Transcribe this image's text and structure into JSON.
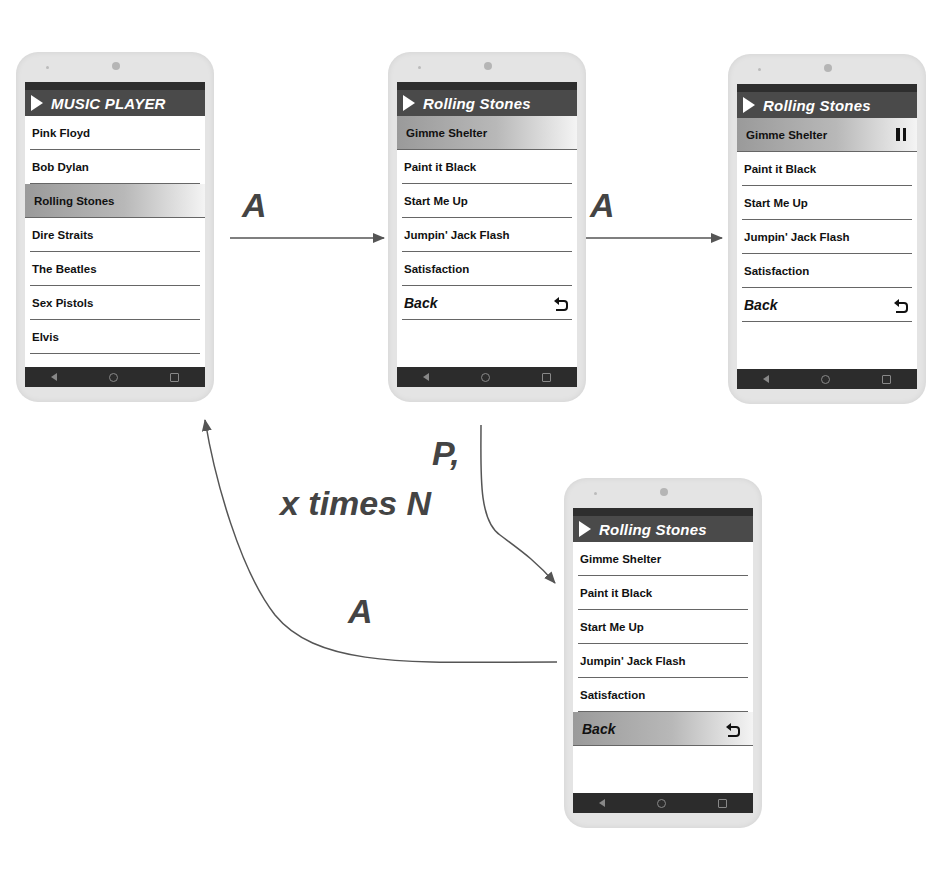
{
  "diagram": {
    "type": "state-transition"
  },
  "phones": [
    {
      "id": "artist-list",
      "title": "MUSIC PLAYER",
      "items": [
        {
          "label": "Pink Floyd",
          "highlighted": false
        },
        {
          "label": "Bob Dylan",
          "highlighted": false
        },
        {
          "label": "Rolling Stones",
          "highlighted": true
        },
        {
          "label": "Dire Straits",
          "highlighted": false
        },
        {
          "label": "The Beatles",
          "highlighted": false
        },
        {
          "label": "Sex Pistols",
          "highlighted": false
        },
        {
          "label": "Elvis",
          "highlighted": false
        }
      ]
    },
    {
      "id": "song-list",
      "title": "Rolling Stones",
      "items": [
        {
          "label": "Gimme Shelter",
          "highlighted": true
        },
        {
          "label": "Paint it Black",
          "highlighted": false
        },
        {
          "label": "Start Me Up",
          "highlighted": false
        },
        {
          "label": "Jumpin' Jack Flash",
          "highlighted": false
        },
        {
          "label": "Satisfaction",
          "highlighted": false
        },
        {
          "label": "Back",
          "highlighted": false,
          "icon": "back-icon"
        }
      ]
    },
    {
      "id": "song-playing",
      "title": "Rolling Stones",
      "items": [
        {
          "label": "Gimme Shelter",
          "highlighted": true,
          "icon": "pause-icon"
        },
        {
          "label": "Paint it Black",
          "highlighted": false
        },
        {
          "label": "Start Me Up",
          "highlighted": false
        },
        {
          "label": "Jumpin' Jack Flash",
          "highlighted": false
        },
        {
          "label": "Satisfaction",
          "highlighted": false
        },
        {
          "label": "Back",
          "highlighted": false,
          "icon": "back-icon"
        }
      ]
    },
    {
      "id": "back-selected",
      "title": "Rolling Stones",
      "items": [
        {
          "label": "Gimme Shelter",
          "highlighted": false
        },
        {
          "label": "Paint it Black",
          "highlighted": false
        },
        {
          "label": "Start Me Up",
          "highlighted": false
        },
        {
          "label": "Jumpin' Jack Flash",
          "highlighted": false
        },
        {
          "label": "Satisfaction",
          "highlighted": false
        },
        {
          "label": "Back",
          "highlighted": true,
          "icon": "back-icon"
        }
      ]
    }
  ],
  "transitions": [
    {
      "from": "artist-list",
      "to": "song-list",
      "label": "A"
    },
    {
      "from": "song-list",
      "to": "song-playing",
      "label": "A"
    },
    {
      "from": "song-list",
      "to": "back-selected",
      "label_line1": "P,",
      "label_line2": "x times N"
    },
    {
      "from": "back-selected",
      "to": "artist-list",
      "label": "A"
    }
  ],
  "colors": {
    "phone_body": "#e4e4e4",
    "title_bar": "#4a4a4a",
    "status_bar": "#2e2e2e",
    "nav_bar": "#2c2c2c",
    "highlight_start": "#9a9a9a",
    "arrow": "#555555"
  }
}
